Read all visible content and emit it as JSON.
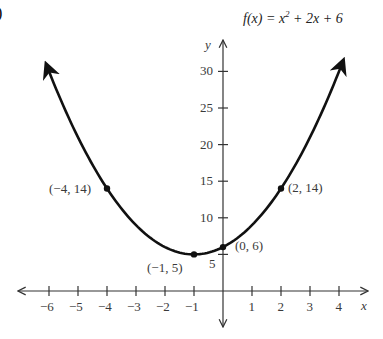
{
  "figure": {
    "corner_glyph": ")",
    "title_fx": "f(x) = x",
    "title_exp": "2",
    "title_rest": " + 2x + 6",
    "x_axis_label": "x",
    "y_axis_label": "y"
  },
  "chart_data": {
    "type": "line",
    "xlabel": "x",
    "ylabel": "y",
    "function": "x^2 + 2x + 6",
    "xlim": [
      -6.5,
      4.5
    ],
    "ylim": [
      -4,
      32
    ],
    "x_ticks": [
      -6,
      -5,
      -4,
      -3,
      -2,
      -1,
      1,
      2,
      3,
      4
    ],
    "y_ticks": [
      5,
      10,
      15,
      20,
      25,
      30
    ],
    "grid": false,
    "curve_domain": [
      -6.1,
      4.15
    ],
    "curve_arrows": true,
    "points": [
      {
        "x": -4,
        "y": 14,
        "label": "(−4, 14)"
      },
      {
        "x": -1,
        "y": 5,
        "label": "(−1, 5)"
      },
      {
        "x": 0,
        "y": 6,
        "label": "(0, 6)"
      },
      {
        "x": 2,
        "y": 14,
        "label": "(2, 14)"
      }
    ]
  }
}
